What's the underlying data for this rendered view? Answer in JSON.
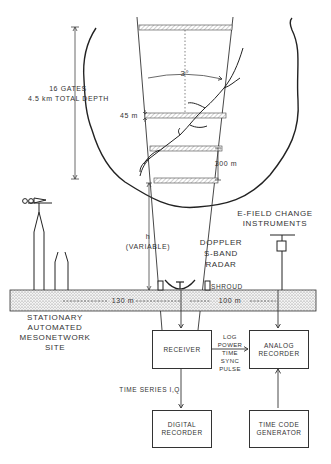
{
  "diagram": {
    "gates_label": "16 GATES\n4.5 km TOTAL DEPTH",
    "gate_spacing": "45 m",
    "gate_interval": "300 m",
    "beam_width": "3°",
    "height_label": "h\n(VARIABLE)",
    "radar_label": "DOPPLER\nS-BAND\nRADAR",
    "shroud_label": "SHROUD",
    "efield_label": "E-FIELD CHANGE\nINSTRUMENTS",
    "distance_left": "130 m",
    "distance_right": "100 m",
    "mesonet_label": "STATIONARY\nAUTOMATED\nMESONETWORK\nSITE",
    "signal_label": "LOG\nPOWER\nTIME\nSYNC\nPULSE",
    "timeseries_label": "TIME SERIES I,Q",
    "boxes": {
      "receiver": "RECEIVER",
      "analog_recorder": "ANALOG\nRECORDER",
      "digital_recorder": "DIGITAL\nRECORDER",
      "time_code_generator": "TIME CODE\nGENERATOR"
    }
  }
}
